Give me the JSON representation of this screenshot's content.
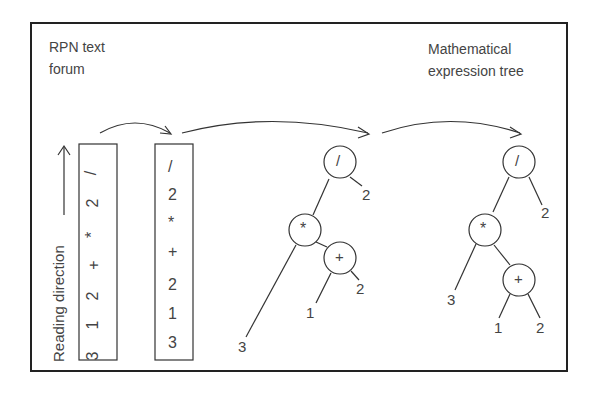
{
  "labels": {
    "left_title_line1": "RPN text",
    "left_title_line2": "forum",
    "right_title_line1": "Mathematical",
    "right_title_line2": "expression tree",
    "reading_direction": "Reading direction"
  },
  "rpn_vertical_tokens": [
    "3",
    "1",
    "2",
    "+",
    "*",
    "2",
    "/"
  ],
  "rpn_stack_tokens": [
    "/",
    "2",
    "*",
    "+",
    "2",
    "1",
    "3"
  ],
  "tree_intermediate": {
    "root": "/",
    "root_right": "2",
    "mul": "*",
    "mul_left": "3",
    "plus": "+",
    "plus_left": "1",
    "plus_right": "2"
  },
  "tree_final": {
    "root": "/",
    "root_right": "2",
    "mul": "*",
    "mul_left": "3",
    "plus": "+",
    "plus_left": "1",
    "plus_right": "2"
  },
  "colors": {
    "stroke": "#333333",
    "frame": "#222222",
    "text": "#444444"
  }
}
